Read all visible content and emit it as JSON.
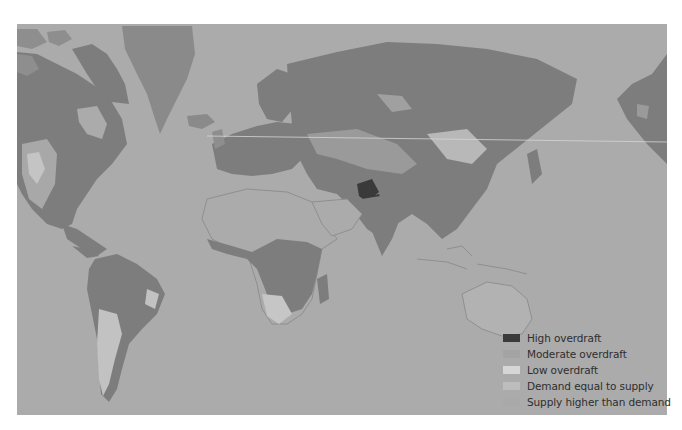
{
  "map": {
    "projection": "Mercator world map",
    "colors": {
      "background": "#ffffff",
      "ocean": "#a9a9a9",
      "land_default": "#7d7d7d",
      "arid_land": "#ababab",
      "high_overdraft": "#3a3a3a",
      "moderate_overdraft": "#9a9a9a",
      "low_overdraft": "#cfcfcf",
      "demand_equal_supply": "#b5b5b5",
      "supply_higher_than_demand": "#a3a3a3"
    }
  },
  "legend": {
    "items": [
      {
        "label": "High overdraft",
        "color": "#3a3a3a"
      },
      {
        "label": "Moderate overdraft",
        "color": "#a4a4a4"
      },
      {
        "label": "Low overdraft",
        "color": "#d6d6d6"
      },
      {
        "label": "Demand equal to supply",
        "color": "#bdbdbd"
      },
      {
        "label": "Supply higher than demand",
        "color": "#a9a9a9"
      }
    ]
  }
}
